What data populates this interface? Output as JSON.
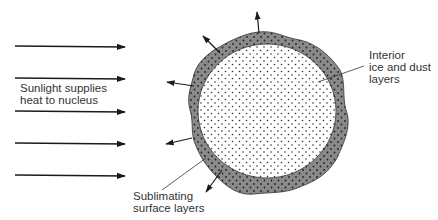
{
  "labels": {
    "sunlight": "Sunlight supplies\nheat to nucleus",
    "interior": "Interior\nice and dust\nlayers",
    "sublimating": "Sublimating\nsurface layers"
  },
  "colors": {
    "ink": "#1a1a1a",
    "surface_layer": "#8a8a8a",
    "interior_fill": "#ffffff",
    "dots": "#333333"
  },
  "incoming_arrows_y": [
    46,
    78,
    111,
    143,
    175
  ],
  "outgoing_arrows": [
    {
      "from": [
        259,
        33
      ],
      "to": [
        257,
        12
      ]
    },
    {
      "from": [
        220,
        53
      ],
      "to": [
        203,
        36
      ]
    },
    {
      "from": [
        194,
        86
      ],
      "to": [
        167,
        82
      ]
    },
    {
      "from": [
        192,
        138
      ],
      "to": [
        166,
        144
      ]
    },
    {
      "from": [
        222,
        170
      ],
      "to": [
        206,
        192
      ]
    }
  ]
}
